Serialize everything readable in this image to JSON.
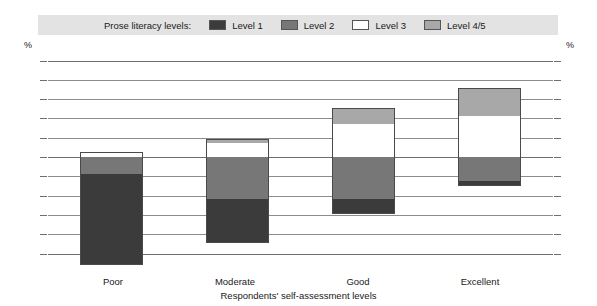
{
  "legend": {
    "title": "Prose literacy levels:",
    "entries": [
      {
        "label": "Level 1",
        "color": "#3b3b3b"
      },
      {
        "label": "Level 2",
        "color": "#777777"
      },
      {
        "label": "Level 3",
        "color": "#ffffff"
      },
      {
        "label": "Level 4/5",
        "color": "#a8a8a8"
      }
    ]
  },
  "axes": {
    "unit_left": "%",
    "unit_right": "%",
    "tick_labels": [
      "100",
      "80",
      "60",
      "40",
      "20",
      "0",
      "20",
      "40",
      "60",
      "80",
      "100"
    ],
    "x_title": "Respondents' self-assessment levels"
  },
  "chart_data": {
    "type": "bar",
    "title": "",
    "subtitle": "",
    "xlabel": "Respondents' self-assessment levels",
    "ylabel": "%",
    "ylim": [
      -100,
      100
    ],
    "grid": true,
    "legend_position": "top",
    "stacked": "diverging",
    "categories": [
      "Poor",
      "Moderate",
      "Good",
      "Excellent"
    ],
    "series": [
      {
        "name": "Level 1",
        "color": "#3b3b3b",
        "direction": "negative",
        "values": [
          94,
          45,
          15,
          5
        ]
      },
      {
        "name": "Level 2",
        "color": "#777777",
        "direction": "negative",
        "values": [
          18,
          44,
          44,
          25
        ]
      },
      {
        "name": "Level 3",
        "color": "#ffffff",
        "direction": "positive",
        "values": [
          5,
          15,
          34,
          42
        ]
      },
      {
        "name": "Level 4/5",
        "color": "#a8a8a8",
        "direction": "positive",
        "values": [
          0,
          4,
          17,
          30
        ]
      }
    ],
    "tick_values": [
      100,
      80,
      60,
      40,
      20,
      0,
      20,
      40,
      60,
      80,
      100
    ]
  }
}
